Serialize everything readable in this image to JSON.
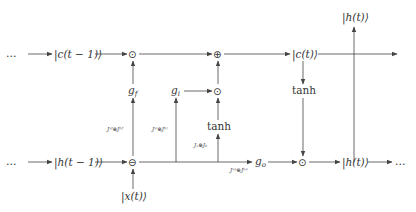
{
  "diagram": {
    "nodes": {
      "ellipsis_top_left": "…",
      "c_prev": "|c(t − 1)⟩",
      "forget_mult": "⊙",
      "cell_add": "⊕",
      "c_t": "|c(t)⟩",
      "h_t_top": "|h(t)⟩",
      "g_f": "g",
      "g_f_sub": "f",
      "g_i": "g",
      "g_i_sub": "i",
      "input_mult": "⊙",
      "tanh_candidate": "tanh",
      "tanh_cell": "tanh",
      "ellipsis_bottom_left": "…",
      "h_prev": "|h(t − 1)⟩",
      "concat": "⊖",
      "x_t": "|x(t)⟩",
      "g_o": "g",
      "g_o_sub": "o",
      "output_mult": "⊙",
      "h_t_bottom": "|h(t)⟩",
      "ellipsis_bottom_right": "…"
    },
    "edge_labels": {
      "forget": "J",
      "forget_full": "Jˣᶠ⊕Jʰᶠ",
      "input_full": "Jˣⁱ⊕Jʰⁱ",
      "candidate_full": "Jₓ⊕Jₕ",
      "output_full": "Jˣᵒ⊕Jʰᵒ"
    }
  }
}
